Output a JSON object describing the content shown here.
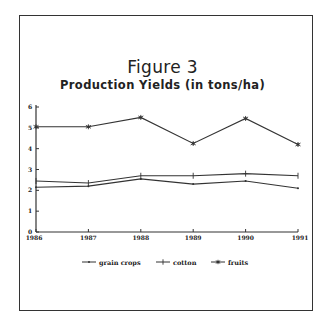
{
  "chart_data": {
    "type": "line",
    "title": "Figure 3",
    "subtitle": "Production Yields (in tons/ha)",
    "xlabel": "",
    "ylabel": "",
    "x": [
      "1986",
      "1987",
      "1988",
      "1989",
      "1990",
      "1991"
    ],
    "ylim": [
      0,
      6
    ],
    "yticks": [
      "0",
      "1",
      "2",
      "3",
      "4",
      "5",
      "6"
    ],
    "grid": false,
    "legend_position": "bottom",
    "series": [
      {
        "name": "grain crops",
        "marker": "dot",
        "values": [
          2.15,
          2.2,
          2.55,
          2.3,
          2.45,
          2.1
        ]
      },
      {
        "name": "cotton",
        "marker": "plus",
        "values": [
          2.45,
          2.35,
          2.7,
          2.7,
          2.8,
          2.7
        ]
      },
      {
        "name": "fruits",
        "marker": "asterisk",
        "values": [
          5.05,
          5.05,
          5.5,
          4.25,
          5.45,
          4.2
        ]
      }
    ]
  },
  "figure": {
    "title": "Figure 3",
    "subtitle": "Production Yields (in tons/ha)"
  },
  "legend": {
    "items": [
      {
        "label": "grain crops"
      },
      {
        "label": "cotton"
      },
      {
        "label": "fruits"
      }
    ]
  },
  "colors": {
    "line": "#333333",
    "frame": "#333333",
    "background": "#ffffff"
  }
}
